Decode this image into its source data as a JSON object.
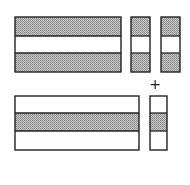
{
  "diagram": {
    "colors": {
      "stroke": "#222222",
      "shade": "#a8a8a8",
      "background": "#ffffff"
    },
    "operator": "+",
    "top_row": [
      {
        "id": "top-large",
        "x": 15,
        "y": 17,
        "w": 106,
        "h": 55,
        "bands": [
          "shaded",
          "white",
          "shaded"
        ],
        "dividers": [
          36,
          53
        ]
      },
      {
        "id": "top-small-1",
        "x": 131,
        "y": 17,
        "w": 19,
        "h": 55,
        "bands": [
          "shaded",
          "white",
          "shaded"
        ],
        "dividers": [
          36,
          53
        ]
      },
      {
        "id": "top-small-2",
        "x": 161,
        "y": 17,
        "w": 19,
        "h": 55,
        "bands": [
          "shaded",
          "white",
          "shaded"
        ],
        "dividers": [
          36,
          53
        ]
      }
    ],
    "bottom_row": [
      {
        "id": "bottom-large",
        "x": 15,
        "y": 96,
        "w": 124,
        "h": 54,
        "bands": [
          "white",
          "shaded",
          "white"
        ],
        "dividers": [
          113,
          131
        ]
      },
      {
        "id": "bottom-small",
        "x": 150,
        "y": 96,
        "w": 17,
        "h": 54,
        "bands": [
          "white",
          "shaded",
          "white"
        ],
        "dividers": [
          113,
          131
        ]
      }
    ]
  }
}
